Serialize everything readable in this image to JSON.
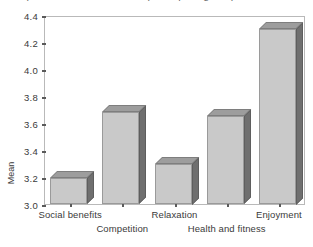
{
  "figure": {
    "clipped_title": "Importance of reasons for participating in sport",
    "y_axis_title": "Mean"
  },
  "chart_data": {
    "type": "bar",
    "title": "",
    "xlabel": "",
    "ylabel": "Mean",
    "categories": [
      "Social benefits",
      "Competition",
      "Relaxation",
      "Health and fitness",
      "Enjoyment"
    ],
    "values": [
      3.19,
      3.68,
      3.3,
      3.65,
      4.3
    ],
    "ylim": [
      3.0,
      4.4
    ],
    "ytick_labels": [
      "3.0",
      "3.2",
      "3.4",
      "3.6",
      "3.8",
      "4.0",
      "4.2",
      "4.4"
    ],
    "ytick_values": [
      3.0,
      3.2,
      3.4,
      3.6,
      3.8,
      4.0,
      4.2,
      4.4
    ],
    "grid": false,
    "legend": null,
    "style": "3d-bars",
    "label_rows": [
      0,
      1,
      0,
      1,
      0
    ],
    "colors": {
      "bar_front": "#c9c9c9",
      "bar_top": "#9d9d9d",
      "bar_side": "#6f6f6f",
      "bar_outline": "#9a9a9a",
      "frame": "#b9b9b9",
      "text": "#3a3a3a",
      "background": "#ffffff"
    }
  }
}
